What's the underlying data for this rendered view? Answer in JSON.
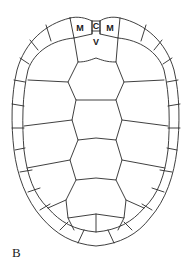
{
  "figure": {
    "panel_label": "B",
    "labels": {
      "marginal_left": "M",
      "cervical": "C",
      "marginal_right": "M",
      "vertebral": "V"
    },
    "colors": {
      "line": "#2a2a2a",
      "background": "#ffffff"
    }
  }
}
